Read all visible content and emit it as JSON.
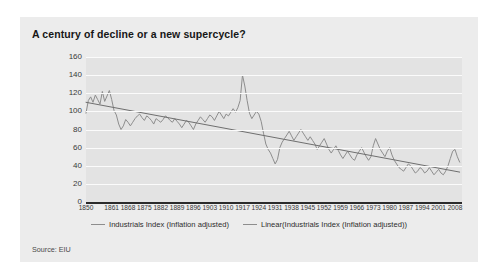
{
  "card": {
    "title": "A century of decline or a new supercycle?",
    "source": "Source: EIU"
  },
  "legend": {
    "position": "bottom-center",
    "entries": [
      {
        "label": "Industrials Index (Inflation adjusted)",
        "color": "#8d8d8d"
      },
      {
        "label": "Linear(Industrials Index (Inflation adjusted))",
        "color": "#8d8d8d"
      }
    ]
  },
  "chart_data": {
    "type": "line",
    "title": "A century of decline or a new supercycle?",
    "xlabel": "",
    "ylabel": "",
    "ylim": [
      0,
      160
    ],
    "xlim": [
      1850,
      2011
    ],
    "ytick_values": [
      0,
      20,
      40,
      60,
      80,
      100,
      120,
      140,
      160
    ],
    "ytick_labels": [
      "0",
      "20",
      "40",
      "60",
      "80",
      "100",
      "120",
      "140",
      "160"
    ],
    "xtick_labels": [
      "1850",
      "1861",
      "1868",
      "1875",
      "1882",
      "1889",
      "1896",
      "1903",
      "1910",
      "1917",
      "1924",
      "1931",
      "1938",
      "1945",
      "1952",
      "1959",
      "1966",
      "1973",
      "1980",
      "1987",
      "1994",
      "2001",
      "2008"
    ],
    "xtick_values": [
      1850,
      1861,
      1868,
      1875,
      1882,
      1889,
      1896,
      1903,
      1910,
      1917,
      1924,
      1931,
      1938,
      1945,
      1952,
      1959,
      1966,
      1973,
      1980,
      1987,
      1994,
      2001,
      2008
    ],
    "grid": "horizontal",
    "grid_color": "#fbfbfb",
    "plot_background": "#e3e3e3",
    "series": [
      {
        "name": "Industrials Index (Inflation adjusted)",
        "type": "line",
        "color": "#8d8d8d",
        "x": [
          1850,
          1851,
          1852,
          1853,
          1854,
          1855,
          1856,
          1857,
          1858,
          1859,
          1860,
          1861,
          1862,
          1863,
          1864,
          1865,
          1866,
          1867,
          1868,
          1869,
          1870,
          1871,
          1872,
          1873,
          1874,
          1875,
          1876,
          1877,
          1878,
          1879,
          1880,
          1881,
          1882,
          1883,
          1884,
          1885,
          1886,
          1887,
          1888,
          1889,
          1890,
          1891,
          1892,
          1893,
          1894,
          1895,
          1896,
          1897,
          1898,
          1899,
          1900,
          1901,
          1902,
          1903,
          1904,
          1905,
          1906,
          1907,
          1908,
          1909,
          1910,
          1911,
          1912,
          1913,
          1914,
          1915,
          1916,
          1917,
          1918,
          1919,
          1920,
          1921,
          1922,
          1923,
          1924,
          1925,
          1926,
          1927,
          1928,
          1929,
          1930,
          1931,
          1932,
          1933,
          1934,
          1935,
          1936,
          1937,
          1938,
          1939,
          1940,
          1941,
          1942,
          1943,
          1944,
          1945,
          1946,
          1947,
          1948,
          1949,
          1950,
          1951,
          1952,
          1953,
          1954,
          1955,
          1956,
          1957,
          1958,
          1959,
          1960,
          1961,
          1962,
          1963,
          1964,
          1965,
          1966,
          1967,
          1968,
          1969,
          1970,
          1971,
          1972,
          1973,
          1974,
          1975,
          1976,
          1977,
          1978,
          1979,
          1980,
          1981,
          1982,
          1983,
          1984,
          1985,
          1986,
          1987,
          1988,
          1989,
          1990,
          1991,
          1992,
          1993,
          1994,
          1995,
          1996,
          1997,
          1998,
          1999,
          2000,
          2001,
          2002,
          2003,
          2004,
          2005,
          2006,
          2007,
          2008,
          2009,
          2010
        ],
        "y": [
          98,
          112,
          116,
          110,
          118,
          113,
          108,
          122,
          111,
          117,
          123,
          113,
          101,
          96,
          86,
          80,
          84,
          91,
          88,
          84,
          88,
          92,
          95,
          97,
          93,
          90,
          95,
          93,
          90,
          86,
          92,
          90,
          88,
          91,
          95,
          93,
          90,
          88,
          92,
          89,
          86,
          82,
          86,
          90,
          88,
          84,
          80,
          86,
          90,
          94,
          91,
          88,
          92,
          96,
          94,
          90,
          95,
          100,
          96,
          92,
          97,
          95,
          99,
          103,
          99,
          104,
          112,
          140,
          128,
          112,
          98,
          92,
          96,
          100,
          97,
          89,
          76,
          64,
          58,
          54,
          48,
          42,
          47,
          60,
          66,
          70,
          74,
          78,
          73,
          68,
          72,
          76,
          80,
          76,
          72,
          68,
          72,
          68,
          64,
          58,
          62,
          66,
          70,
          64,
          58,
          54,
          58,
          62,
          57,
          52,
          48,
          52,
          56,
          52,
          48,
          46,
          52,
          56,
          60,
          55,
          50,
          46,
          50,
          62,
          70,
          64,
          58,
          54,
          50,
          56,
          60,
          52,
          46,
          42,
          38,
          36,
          34,
          38,
          42,
          40,
          36,
          32,
          34,
          38,
          36,
          32,
          34,
          38,
          34,
          30,
          33,
          36,
          32,
          30,
          34,
          40,
          48,
          56,
          58,
          50,
          44
        ]
      },
      {
        "name": "Linear(Industrials Index (Inflation adjusted))",
        "type": "line",
        "color": "#6f6f6f",
        "x": [
          1850,
          2010
        ],
        "y": [
          110,
          33
        ]
      }
    ]
  }
}
